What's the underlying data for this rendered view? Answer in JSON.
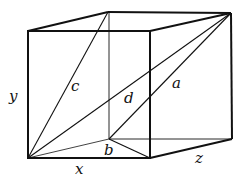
{
  "diagram": {
    "vertices": {
      "front_top_left": [
        28,
        31
      ],
      "front_top_right": [
        150,
        31
      ],
      "front_bottom_left": [
        28,
        158
      ],
      "front_bottom_right": [
        150,
        158
      ],
      "back_top_left": [
        108,
        12
      ],
      "back_top_right": [
        231,
        13
      ],
      "back_bottom_left": [
        109,
        139
      ],
      "back_bottom_right": [
        232,
        139
      ]
    },
    "labels": {
      "x": "x",
      "y": "y",
      "z": "z",
      "a": "a",
      "b": "b",
      "c": "c",
      "d": "d"
    },
    "colors": {
      "line": "#111111",
      "background": "#ffffff"
    }
  }
}
